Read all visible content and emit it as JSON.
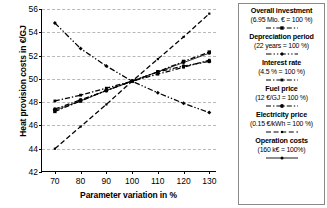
{
  "chart_data": {
    "type": "line",
    "title": "",
    "xlabel": "Parameter variation in %",
    "ylabel": "Heat provision costs in €/GJ",
    "x": [
      70,
      80,
      90,
      100,
      110,
      120,
      130
    ],
    "xlim": [
      65,
      133
    ],
    "ylim": [
      42,
      56
    ],
    "xticks": [
      70,
      80,
      90,
      100,
      110,
      120,
      130
    ],
    "yticks": [
      42,
      44,
      46,
      48,
      50,
      52,
      54,
      56
    ],
    "grid": "horizontal-dashed",
    "legend_position": "right",
    "series": [
      {
        "name": "Overall investment",
        "reference": "(6.95 Mio. € = 100 %)",
        "marker": "square",
        "dash": "dash-dot",
        "values": [
          47.2,
          48.1,
          49.0,
          49.8,
          50.6,
          51.5,
          52.3
        ]
      },
      {
        "name": "Depreciation period",
        "reference": "(22 years = 100 %)",
        "marker": "diamond",
        "dash": "dash-dot-dot",
        "values": [
          54.8,
          52.6,
          51.1,
          49.8,
          48.8,
          47.9,
          47.1
        ]
      },
      {
        "name": "Interest rate",
        "reference": "(4.5 % = 100 %)",
        "marker": "square-small",
        "dash": "dash-dot",
        "values": [
          48.1,
          48.6,
          49.2,
          49.8,
          50.4,
          51.0,
          51.6
        ]
      },
      {
        "name": "Fuel price",
        "reference": "(12 €/GJ = 100 %)",
        "marker": "circle",
        "dash": "dash-dot",
        "values": [
          47.4,
          48.2,
          49.0,
          49.8,
          50.6,
          51.1,
          51.5
        ]
      },
      {
        "name": "Electricity price",
        "reference": "(0.15 €/kWh = 100 %)",
        "marker": "square-tiny",
        "dash": "dash",
        "values": [
          44.0,
          45.9,
          47.8,
          49.8,
          51.7,
          53.6,
          55.6
        ]
      },
      {
        "name": "Operation costs",
        "reference": "(160 k€ = 100%)",
        "marker": "dot",
        "dash": "solid",
        "values": [
          47.3,
          48.1,
          49.0,
          49.8,
          50.6,
          51.4,
          52.2
        ]
      }
    ]
  },
  "axes": {
    "y_label": "Heat provision costs in €/GJ",
    "x_label": "Parameter variation in %",
    "y_tick_labels": [
      "42",
      "44",
      "46",
      "48",
      "50",
      "52",
      "54",
      "56"
    ],
    "x_tick_labels": [
      "70",
      "80",
      "90",
      "100",
      "110",
      "120",
      "130"
    ]
  },
  "legend": {
    "entries": [
      {
        "name": "Overall investment",
        "value": "(6.95 Mio. € = 100 %)"
      },
      {
        "name": "Depreciation period",
        "value": "(22 years = 100 %)"
      },
      {
        "name": "Interest rate",
        "value": "(4.5 % = 100 %)"
      },
      {
        "name": "Fuel price",
        "value": "(12 €/GJ = 100 %)"
      },
      {
        "name": "Electricity price",
        "value": "(0.15 €/kWh = 100 %)"
      },
      {
        "name": "Operation costs",
        "value": "(160 k€ = 100%)"
      }
    ]
  },
  "colors": {
    "line": "#000000",
    "grid": "#b9b9b9",
    "axis": "#000000",
    "legend_border": "#8a8a8a",
    "background": "#ffffff"
  }
}
